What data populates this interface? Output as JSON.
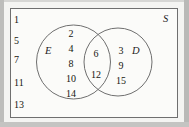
{
  "diagram": {
    "type": "venn",
    "universe": {
      "label": "S",
      "name": "universal-set"
    },
    "sets": [
      {
        "label": "E",
        "name": "set-e"
      },
      {
        "label": "D",
        "name": "set-d"
      }
    ],
    "regions": {
      "outside_both": {
        "name": "outside-both-region",
        "elements": [
          "1",
          "5",
          "7",
          "11",
          "13"
        ]
      },
      "only_e": {
        "name": "only-e-region",
        "elements": [
          "2",
          "4",
          "8",
          "10",
          "14"
        ]
      },
      "intersection": {
        "name": "intersection-region",
        "elements": [
          "6",
          "12"
        ]
      },
      "only_d": {
        "name": "only-d-region",
        "elements": [
          "3",
          "9",
          "15"
        ]
      }
    }
  },
  "colors": {
    "stroke": "#6f6f6f",
    "text": "#16160f",
    "page": "#fbfbf9",
    "margin": "#d6d6d4"
  }
}
